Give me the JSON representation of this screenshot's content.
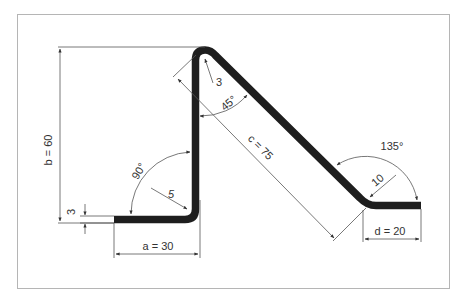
{
  "diagram": {
    "colors": {
      "frame": "#b5b5b5",
      "strip": "#1e1e1e",
      "dimension_line": "#555555",
      "text": "#333333",
      "background": "#ffffff"
    },
    "labels": {
      "a": "a = 30",
      "b": "b = 60",
      "c": "c = 75",
      "d": "d = 20",
      "thickness": "3",
      "radius_bottom": "5",
      "radius_top": "3",
      "radius_right": "10",
      "angle_bottom": "90°",
      "angle_top": "45°",
      "angle_right": "135°"
    },
    "dimensions": [
      {
        "name": "a",
        "value": 30
      },
      {
        "name": "b",
        "value": 60
      },
      {
        "name": "c",
        "value": 75
      },
      {
        "name": "d",
        "value": 20
      },
      {
        "name": "thickness",
        "value": 3
      },
      {
        "name": "inner_radius_bottom",
        "value": 5
      },
      {
        "name": "inner_radius_top",
        "value": 3
      },
      {
        "name": "inner_radius_right",
        "value": 10
      },
      {
        "name": "angle_bottom",
        "value": 90,
        "unit": "°"
      },
      {
        "name": "angle_top",
        "value": 45,
        "unit": "°"
      },
      {
        "name": "angle_right",
        "value": 135,
        "unit": "°"
      }
    ]
  }
}
